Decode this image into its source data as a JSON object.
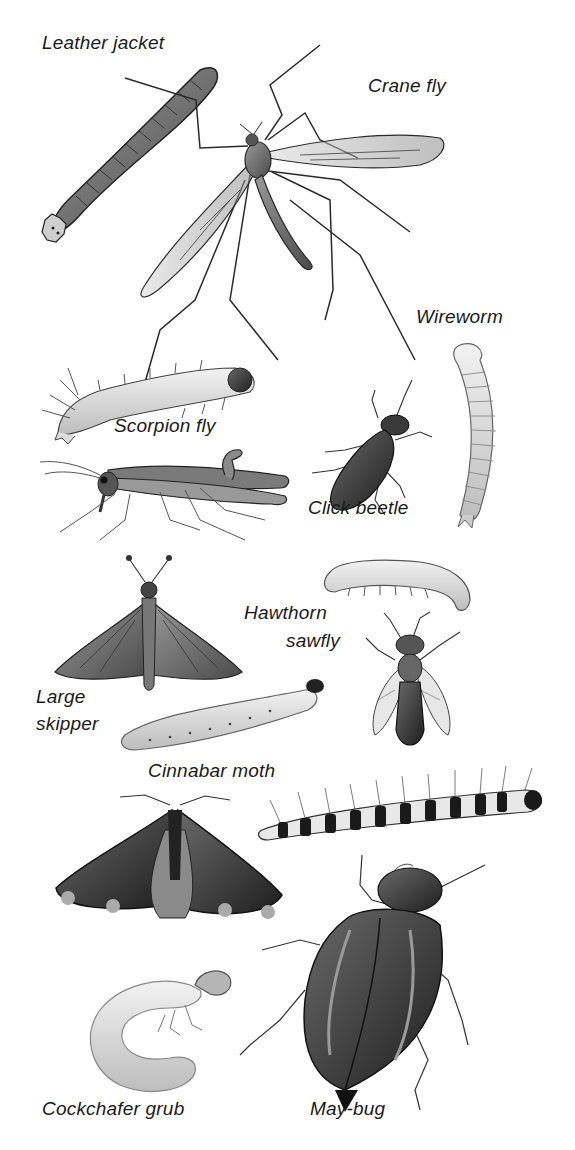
{
  "plate": {
    "background": "#ffffff",
    "ink": "#1a1a1a",
    "labels": [
      {
        "id": "leather-jacket",
        "text": "Leather jacket",
        "x": 42,
        "y": 32
      },
      {
        "id": "crane-fly",
        "text": "Crane fly",
        "x": 368,
        "y": 75
      },
      {
        "id": "wireworm",
        "text": "Wireworm",
        "x": 416,
        "y": 306
      },
      {
        "id": "scorpion-fly",
        "text": "Scorpion fly",
        "x": 114,
        "y": 415
      },
      {
        "id": "click-beetle",
        "text": "Click beetle",
        "x": 308,
        "y": 497
      },
      {
        "id": "hawthorn-sawfly-1",
        "text": "Hawthorn",
        "x": 244,
        "y": 602
      },
      {
        "id": "hawthorn-sawfly-2",
        "text": "sawfly",
        "x": 286,
        "y": 630
      },
      {
        "id": "large-skipper-1",
        "text": "Large",
        "x": 36,
        "y": 686
      },
      {
        "id": "large-skipper-2",
        "text": "skipper",
        "x": 36,
        "y": 713
      },
      {
        "id": "cinnabar-moth",
        "text": "Cinnabar moth",
        "x": 148,
        "y": 760
      },
      {
        "id": "cockchafer-grub",
        "text": "Cockchafer grub",
        "x": 42,
        "y": 1098
      },
      {
        "id": "may-bug",
        "text": "May-bug",
        "x": 310,
        "y": 1098
      }
    ],
    "specimens": [
      "leather-jacket",
      "crane-fly",
      "scorpion-fly-larva",
      "scorpion-fly",
      "click-beetle",
      "wireworm",
      "hawthorn-sawfly-larva",
      "hawthorn-sawfly",
      "large-skipper",
      "large-skipper-larva",
      "cinnabar-moth",
      "cinnabar-larva",
      "cockchafer-grub",
      "may-bug"
    ]
  }
}
